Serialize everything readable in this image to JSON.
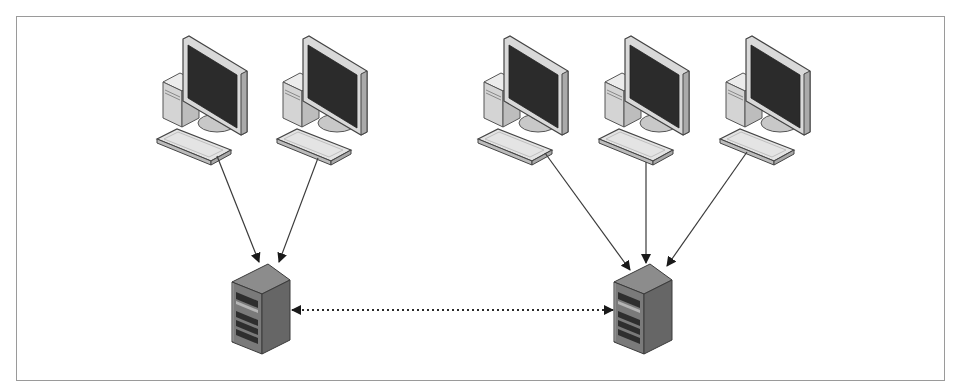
{
  "diagram": {
    "type": "network-topology",
    "colors": {
      "background": "#ffffff",
      "frame": "#9a9a9a",
      "line": "#3a3a3a",
      "screen": "#2b2b2b",
      "bezel": "#d6d6d6",
      "server_front": "#7a7a7a",
      "server_side": "#6a6a6a",
      "server_top": "#8c8c8c"
    },
    "groups": [
      {
        "id": "left-group",
        "server": {
          "id": "server-1",
          "label": "Server 1"
        },
        "clients": [
          {
            "id": "client-1",
            "label": "Workstation 1"
          },
          {
            "id": "client-2",
            "label": "Workstation 2"
          }
        ]
      },
      {
        "id": "right-group",
        "server": {
          "id": "server-2",
          "label": "Server 2"
        },
        "clients": [
          {
            "id": "client-3",
            "label": "Workstation 3"
          },
          {
            "id": "client-4",
            "label": "Workstation 4"
          },
          {
            "id": "client-5",
            "label": "Workstation 5"
          }
        ]
      }
    ],
    "edges": [
      {
        "from": "client-1",
        "to": "server-1",
        "style": "solid",
        "direction": "forward"
      },
      {
        "from": "client-2",
        "to": "server-1",
        "style": "solid",
        "direction": "forward"
      },
      {
        "from": "client-3",
        "to": "server-2",
        "style": "solid",
        "direction": "forward"
      },
      {
        "from": "client-4",
        "to": "server-2",
        "style": "solid",
        "direction": "forward"
      },
      {
        "from": "client-5",
        "to": "server-2",
        "style": "solid",
        "direction": "forward"
      },
      {
        "from": "server-1",
        "to": "server-2",
        "style": "dotted",
        "direction": "bidirectional"
      }
    ]
  }
}
